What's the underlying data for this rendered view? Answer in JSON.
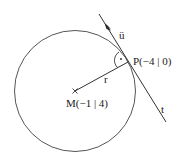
{
  "diagram": {
    "circle": {
      "label": "circle",
      "center_label": "M(−1 | 4)"
    },
    "point_p": {
      "label": "P(−4 | 0)"
    },
    "radius": {
      "label": "r"
    },
    "direction_vector": {
      "label": "ü"
    },
    "tangent": {
      "label": "t"
    },
    "right_angle_marker": {
      "symbol": "·"
    },
    "colors": {
      "stroke": "#333333",
      "background": "#ffffff"
    }
  }
}
